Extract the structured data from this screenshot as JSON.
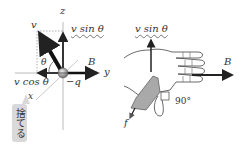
{
  "left_diagram": {
    "axis_z": "z",
    "axis_y": "y",
    "axis_x": "x",
    "vector_v": "v",
    "vector_B": "B",
    "angle": "θ",
    "charge": "−q",
    "component_sin": "v sin θ",
    "component_cos": "v cos θ",
    "note": "捨てる"
  },
  "right_diagram": {
    "component_sin": "v sin θ",
    "vector_B": "B",
    "force_f": "f",
    "angle_label": "90°"
  },
  "colors": {
    "line": "#222222",
    "guide": "#999999",
    "thumb_fill": "#a9a9a9",
    "note_bg": "#d9d9d9"
  }
}
